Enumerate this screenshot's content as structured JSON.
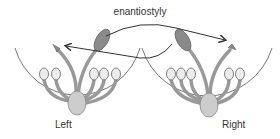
{
  "diagram": {
    "title": "enantiostyly",
    "flowers": [
      {
        "label": "Left",
        "style_direction": "left"
      },
      {
        "label": "Right",
        "style_direction": "right"
      }
    ],
    "colors": {
      "outline": "#555555",
      "filament": "#999999",
      "anther": "#ececec",
      "large_anther": "#8a8a8a",
      "ovary": "#cccccc",
      "arrow": "#333333"
    }
  }
}
